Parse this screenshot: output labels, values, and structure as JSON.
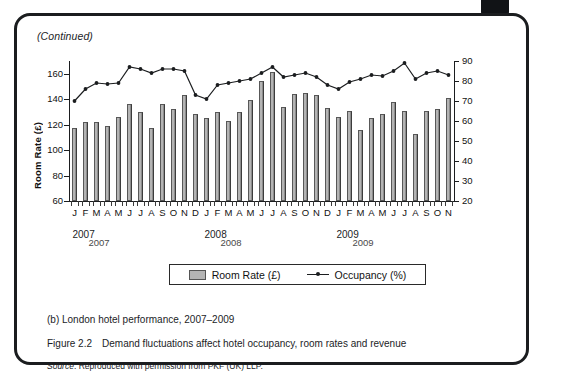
{
  "page": {
    "continued_note": "(Continued)",
    "corner_mark": "page-edge-mark"
  },
  "chart_data": {
    "type": "bar",
    "title": "",
    "subtitle": "",
    "xlabel": "",
    "ylabel": "Room Rate (£)",
    "ylabel_right": "Occupancy (%)",
    "ylim": [
      60,
      170
    ],
    "yticks": [
      60,
      80,
      100,
      120,
      140,
      160
    ],
    "ylim_right": [
      20,
      90
    ],
    "yticks_right": [
      20,
      30,
      40,
      50,
      60,
      70,
      80,
      90
    ],
    "grid": false,
    "legend_position": "bottom-center",
    "categories": [
      "J",
      "F",
      "M",
      "A",
      "M",
      "J",
      "J",
      "A",
      "S",
      "O",
      "N",
      "D",
      "J",
      "F",
      "M",
      "A",
      "M",
      "J",
      "J",
      "A",
      "S",
      "O",
      "N",
      "D",
      "J",
      "F",
      "M",
      "A",
      "M",
      "J",
      "J",
      "A",
      "S",
      "O",
      "N"
    ],
    "year_groups": [
      {
        "label": "2007",
        "start_index": 0,
        "end_index": 11
      },
      {
        "label": "2008",
        "start_index": 12,
        "end_index": 23
      },
      {
        "label": "2009",
        "start_index": 24,
        "end_index": 34
      }
    ],
    "year_label_duplicates": [
      "2007",
      "2008",
      "2009"
    ],
    "series": [
      {
        "name": "Room Rate (£)",
        "kind": "bar",
        "axis": "left",
        "color": "#b4b4b4",
        "values": [
          117,
          122,
          122,
          119,
          126,
          136,
          130,
          117,
          136,
          132,
          143,
          128,
          125,
          130,
          123,
          130,
          139,
          154,
          161,
          134,
          144,
          145,
          143,
          133,
          126,
          131,
          116,
          125,
          128,
          138,
          131,
          113,
          131,
          132,
          141
        ]
      },
      {
        "name": "Occupancy (%)",
        "kind": "line",
        "axis": "right",
        "color": "#1b1d1f",
        "values": [
          70,
          76,
          79,
          78.5,
          79,
          87,
          86,
          84,
          86,
          86,
          85,
          73,
          71,
          78,
          79,
          80,
          81,
          84,
          87,
          82,
          83,
          84,
          82,
          78,
          76,
          79.5,
          81,
          83,
          82.5,
          85,
          89,
          81,
          84,
          85,
          83
        ]
      }
    ]
  },
  "legend": {
    "bar_label": "Room Rate (£)",
    "line_label": "Occupancy (%)"
  },
  "captions": {
    "subfigure": "(b) London hotel performance, 2007–2009",
    "figure_number": "Figure 2.2",
    "figure_title": "Demand fluctuations affect hotel occupancy, room rates and revenue",
    "source_word": "Source",
    "source_text": ": Reproduced with permission from PKF (UK) LLP."
  }
}
